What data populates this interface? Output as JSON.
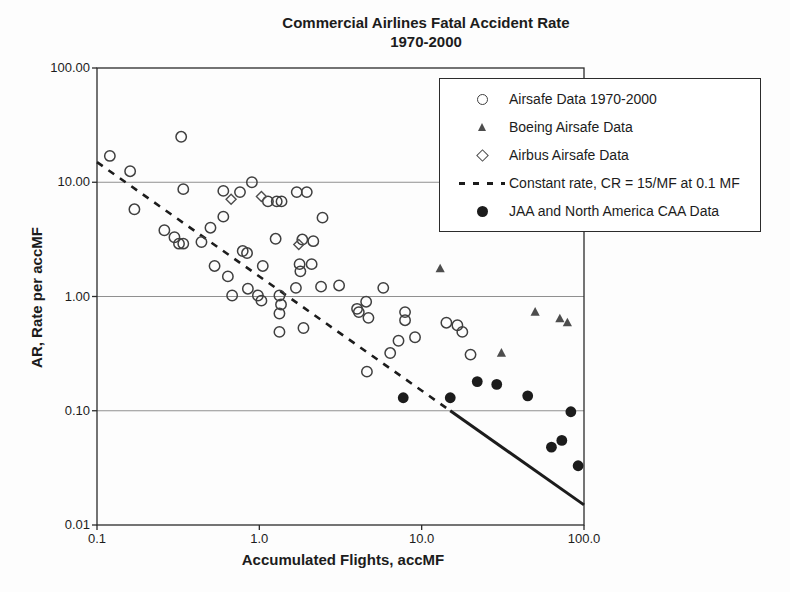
{
  "title": {
    "line1": "Commercial Airlines Fatal Accident Rate",
    "line2": "1970-2000"
  },
  "axes": {
    "x": {
      "label": "Accumulated Flights, accMF",
      "scale": "log",
      "range": [
        0.1,
        100
      ],
      "ticks": [
        "0.1",
        "1.0",
        "10.0",
        "100.0"
      ],
      "tick_values": [
        0.1,
        1,
        10,
        100
      ]
    },
    "y": {
      "label": "AR, Rate per accMF",
      "scale": "log",
      "range": [
        0.01,
        100
      ],
      "ticks": [
        "100.00",
        "10.00",
        "1.00",
        "0.10",
        "0.01"
      ],
      "tick_values": [
        100,
        10,
        1,
        0.1,
        0.01
      ]
    }
  },
  "legend": {
    "items": [
      {
        "label": "Airsafe Data 1970-2000",
        "marker": "open-circle"
      },
      {
        "label": "Boeing Airsafe Data",
        "marker": "filled-triangle"
      },
      {
        "label": "Airbus Airsafe Data",
        "marker": "open-diamond"
      },
      {
        "label": "Constant rate, CR = 15/MF at 0.1 MF",
        "marker": "dashed-line"
      },
      {
        "label": "JAA and North America CAA Data",
        "marker": "filled-circle"
      }
    ]
  },
  "colors": {
    "text": "#1c1c1c",
    "frame": "#2b2b2b",
    "grid": "#909090",
    "open_marker_stroke": "#3f3f3f",
    "gray_marker": "#4d4d4d",
    "filled_marker": "#1c1c1c",
    "line": "#1c1c1c",
    "legend_bg": "#ffffff"
  },
  "chart_data": {
    "type": "scatter",
    "title": "Commercial Airlines Fatal Accident Rate 1970-2000",
    "xlabel": "Accumulated Flights, accMF",
    "ylabel": "AR, Rate per accMF",
    "xscale": "log",
    "yscale": "log",
    "xlim": [
      0.1,
      100
    ],
    "ylim": [
      0.01,
      100
    ],
    "grid": "horizontal-only",
    "legend_position": "top-right-overlay",
    "series": [
      {
        "name": "Airsafe Data 1970-2000",
        "marker": "open-circle",
        "points": [
          [
            0.12,
            17
          ],
          [
            0.16,
            12.5
          ],
          [
            0.33,
            25
          ],
          [
            0.34,
            8.7
          ],
          [
            0.17,
            5.8
          ],
          [
            0.26,
            3.8
          ],
          [
            0.3,
            3.3
          ],
          [
            0.32,
            2.9
          ],
          [
            0.34,
            2.9
          ],
          [
            0.44,
            3.0
          ],
          [
            0.5,
            4.0
          ],
          [
            0.53,
            1.85
          ],
          [
            0.6,
            5.0
          ],
          [
            0.6,
            8.4
          ],
          [
            0.64,
            1.5
          ],
          [
            0.68,
            1.02
          ],
          [
            0.76,
            8.2
          ],
          [
            0.79,
            2.5
          ],
          [
            0.84,
            2.4
          ],
          [
            0.85,
            1.17
          ],
          [
            0.9,
            10
          ],
          [
            0.98,
            1.02
          ],
          [
            1.03,
            0.92
          ],
          [
            1.05,
            1.85
          ],
          [
            1.13,
            6.8
          ],
          [
            1.28,
            6.8
          ],
          [
            1.37,
            6.8
          ],
          [
            1.26,
            3.2
          ],
          [
            1.33,
            1.02
          ],
          [
            1.36,
            0.85
          ],
          [
            1.33,
            0.71
          ],
          [
            1.33,
            0.49
          ],
          [
            1.68,
            1.19
          ],
          [
            1.7,
            8.2
          ],
          [
            1.96,
            8.2
          ],
          [
            1.77,
            1.92
          ],
          [
            1.79,
            1.66
          ],
          [
            1.84,
            3.15
          ],
          [
            1.87,
            0.53
          ],
          [
            2.1,
            1.92
          ],
          [
            2.15,
            3.05
          ],
          [
            2.4,
            1.22
          ],
          [
            2.45,
            4.9
          ],
          [
            3.1,
            1.25
          ],
          [
            4.0,
            0.78
          ],
          [
            4.1,
            0.73
          ],
          [
            4.55,
            0.9
          ],
          [
            4.7,
            0.65
          ],
          [
            4.6,
            0.22
          ],
          [
            5.8,
            1.19
          ],
          [
            6.4,
            0.32
          ],
          [
            7.2,
            0.41
          ],
          [
            7.9,
            0.73
          ],
          [
            7.9,
            0.62
          ],
          [
            9.1,
            0.44
          ],
          [
            14.2,
            0.59
          ],
          [
            16.6,
            0.56
          ],
          [
            17.8,
            0.49
          ],
          [
            20.0,
            0.31
          ]
        ]
      },
      {
        "name": "Boeing Airsafe Data",
        "marker": "filled-triangle",
        "points": [
          [
            13,
            1.75
          ],
          [
            31,
            0.32
          ],
          [
            50,
            0.73
          ],
          [
            71,
            0.64
          ],
          [
            79,
            0.59
          ]
        ]
      },
      {
        "name": "Airbus Airsafe Data",
        "marker": "open-diamond",
        "points": [
          [
            0.67,
            7.1
          ],
          [
            1.03,
            7.5
          ],
          [
            1.75,
            2.85
          ]
        ]
      },
      {
        "name": "JAA and North America CAA Data",
        "marker": "filled-circle",
        "points": [
          [
            7.7,
            0.13
          ],
          [
            15,
            0.13
          ],
          [
            22,
            0.18
          ],
          [
            29,
            0.17
          ],
          [
            45,
            0.135
          ],
          [
            63,
            0.048
          ],
          [
            73,
            0.055
          ],
          [
            83,
            0.098
          ],
          [
            92,
            0.033
          ]
        ]
      }
    ],
    "line": {
      "name": "Constant rate, CR = 15/MF at 0.1 MF",
      "equation": "AR = 1.5 / accMF",
      "dashed_from": [
        0.1,
        15
      ],
      "dashed_to": [
        15,
        0.1
      ],
      "solid_to": [
        100,
        0.015
      ]
    }
  }
}
